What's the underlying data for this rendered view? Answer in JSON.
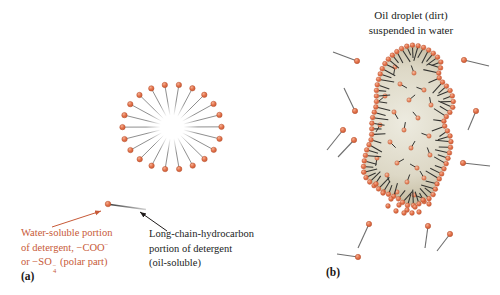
{
  "title_b": {
    "line1": "Oil droplet (dirt)",
    "line2": "suspended in water"
  },
  "panel_a_label": "(a)",
  "panel_b_label": "(b)",
  "water_label_lines": [
    [
      {
        "t": "Water-soluble portion"
      }
    ],
    [
      {
        "t": "of detergent, −COO"
      },
      {
        "sup": "−"
      }
    ],
    [
      {
        "t": "or −SO"
      },
      {
        "stack": {
          "sup": "−",
          "sub": "4"
        }
      },
      {
        "t": " (polar part)"
      }
    ]
  ],
  "hydro_label_lines": [
    "Long-chain-hydrocarbon",
    "portion of detergent",
    "(oil-soluble)"
  ],
  "colors": {
    "background": "#ffffff",
    "orange_text": "#c75a38",
    "black_text": "#211d1c",
    "ball_highlight": "#f6b193",
    "ball_main": "#e3714a",
    "ball_dark": "#c1522c",
    "ball_stroke": "#b5512e",
    "ball_light_main": "#e98a63",
    "micelle_line": "#8f8f8f",
    "free_tail": "#6e6e6e",
    "blob_tail": "#32322f",
    "blob_center": "#edebe0",
    "blob_mid": "#d9d4c2",
    "blob_edge": "#a89d82",
    "arrow_orange": "#c75a38",
    "arrow_black": "#1f1b1a"
  },
  "figure": {
    "micelle": {
      "cx": 172,
      "cy": 127,
      "arms": 22,
      "rx": 49.5,
      "ry": 42.5,
      "start_deg": -82,
      "inner_rx": 8,
      "inner_ry": 7,
      "ball_r": 2.7,
      "fade_r": 26
    },
    "single_molecule": {
      "ball": [
        108,
        204
      ],
      "tail": [
        146,
        209.5
      ],
      "ball_r": 2.8
    },
    "arrows": {
      "orange": {
        "from": [
          52,
          227
        ],
        "to": [
          101,
          211
        ]
      },
      "black": {
        "from": [
          167,
          231
        ],
        "to": [
          140,
          212
        ]
      }
    },
    "blob": {
      "centroid": [
        408,
        128
      ],
      "outline": [
        [
          407,
          47
        ],
        [
          425,
          49
        ],
        [
          440,
          62
        ],
        [
          438,
          77
        ],
        [
          450,
          92
        ],
        [
          452,
          107
        ],
        [
          443,
          122
        ],
        [
          450,
          139
        ],
        [
          447,
          159
        ],
        [
          437,
          182
        ],
        [
          430,
          197
        ],
        [
          410,
          205
        ],
        [
          397,
          197
        ],
        [
          380,
          189
        ],
        [
          365,
          174
        ],
        [
          367,
          152
        ],
        [
          372,
          139
        ],
        [
          373,
          120
        ],
        [
          377,
          105
        ],
        [
          378,
          85
        ],
        [
          387,
          62
        ]
      ],
      "perimeter_ball_r": 2.4,
      "perimeter_spacing": 5.6,
      "interior": [
        [
          395,
          67,
          100
        ],
        [
          414,
          73,
          250
        ],
        [
          400,
          84,
          30
        ],
        [
          424,
          90,
          200
        ],
        [
          385,
          96,
          140
        ],
        [
          409,
          100,
          320
        ],
        [
          431,
          105,
          260
        ],
        [
          394,
          112,
          60
        ],
        [
          418,
          118,
          230
        ],
        [
          380,
          125,
          120
        ],
        [
          404,
          130,
          280
        ],
        [
          429,
          136,
          200
        ],
        [
          390,
          142,
          45
        ],
        [
          411,
          148,
          300
        ],
        [
          430,
          155,
          250
        ],
        [
          377,
          158,
          100
        ],
        [
          397,
          163,
          330
        ],
        [
          417,
          168,
          210
        ],
        [
          387,
          175,
          70
        ],
        [
          407,
          182,
          290
        ],
        [
          424,
          178,
          240
        ],
        [
          397,
          192,
          130
        ],
        [
          414,
          195,
          20
        ]
      ],
      "interior_ball_r": 2.2,
      "interior_tail_len": 8,
      "extra_balls": [
        [
          383,
          193
        ],
        [
          391,
          199
        ],
        [
          399,
          205
        ],
        [
          407,
          210
        ],
        [
          415,
          207
        ],
        [
          423,
          200
        ],
        [
          396,
          211
        ],
        [
          388,
          206
        ],
        [
          404,
          213
        ],
        [
          412,
          213
        ],
        [
          429,
          204
        ],
        [
          376,
          184
        ],
        [
          419,
          212
        ]
      ]
    },
    "free_molecules": [
      {
        "ball": [
          357,
          61
        ],
        "tail": [
          333,
          52
        ]
      },
      {
        "ball": [
          355,
          111
        ],
        "tail": [
          344,
          88
        ]
      },
      {
        "ball": [
          343,
          130
        ],
        "tail": [
          327,
          150
        ]
      },
      {
        "ball": [
          354,
          140
        ],
        "tail": [
          338,
          157
        ]
      },
      {
        "ball": [
          464,
          60
        ],
        "tail": [
          489,
          66
        ]
      },
      {
        "ball": [
          476,
          111
        ],
        "tail": [
          468,
          130
        ]
      },
      {
        "ball": [
          463,
          163
        ],
        "tail": [
          490,
          166
        ]
      },
      {
        "ball": [
          369,
          224
        ],
        "tail": [
          358,
          248
        ]
      },
      {
        "ball": [
          428,
          226
        ],
        "tail": [
          425,
          248
        ]
      },
      {
        "ball": [
          450,
          234
        ],
        "tail": [
          437,
          251
        ]
      },
      {
        "ball": [
          358,
          257
        ],
        "tail": [
          337,
          254
        ]
      }
    ],
    "free_ball_r": 2.7
  }
}
